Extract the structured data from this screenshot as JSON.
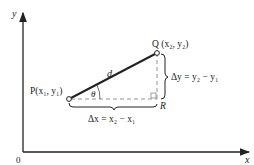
{
  "diagram": {
    "type": "distance-between-two-points",
    "axes": {
      "x_label": "x",
      "y_label": "y",
      "origin_label": "0"
    },
    "points": {
      "P": {
        "name": "P",
        "coords": "(x",
        "label": "P(x₁, y₁)"
      },
      "Q": {
        "name": "Q",
        "label": "Q (x₂, y₂)"
      },
      "R": {
        "name": "R",
        "label": "R"
      }
    },
    "segment_label": "d",
    "angle_label": "θ",
    "delta_x_label": "Δx = x₂ − x₁",
    "delta_y_label": "Δy = y₂ − y₁",
    "colors": {
      "line": "#222222",
      "dashed": "#888888",
      "background": "#ffffff"
    }
  }
}
